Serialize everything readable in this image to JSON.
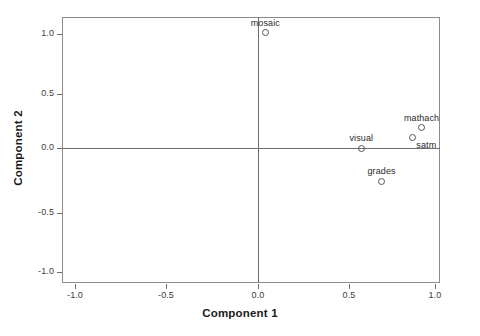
{
  "chart_data": {
    "type": "scatter",
    "title": "",
    "xlabel": "Component 1",
    "ylabel": "Component 2",
    "xlim": [
      -1.15,
      1.15
    ],
    "ylim": [
      -1.15,
      1.15
    ],
    "xticks": [
      "-1.0",
      "-0.5",
      "0.0",
      "0.5",
      "1.0"
    ],
    "xtick_values": [
      -1.0,
      -0.5,
      0.0,
      0.5,
      1.0
    ],
    "yticks": [
      "-1.0",
      "-0.5",
      "0.0",
      "0.5",
      "1.0"
    ],
    "ytick_values": [
      -1.0,
      -0.5,
      0.0,
      0.5,
      1.0
    ],
    "grid": false,
    "legend": "none",
    "reference_lines": {
      "x": 0.0,
      "y": 0.0
    },
    "marker": "open-circle",
    "points": [
      {
        "label": "mosaic",
        "x": 0.04,
        "y": 0.97,
        "label_pos": "above"
      },
      {
        "label": "mathach",
        "x": 0.9,
        "y": 0.17,
        "label_pos": "above"
      },
      {
        "label": "satm",
        "x": 0.85,
        "y": 0.085,
        "label_pos": "below-right"
      },
      {
        "label": "visual",
        "x": 0.57,
        "y": 0.0,
        "label_pos": "above"
      },
      {
        "label": "grades",
        "x": 0.68,
        "y": -0.28,
        "label_pos": "above"
      }
    ]
  },
  "axes": {
    "x_title": "Component 1",
    "y_title": "Component 2",
    "x_tick_labels": [
      "-1.0",
      "-0.5",
      "0.0",
      "0.5",
      "1.0"
    ],
    "y_tick_labels": [
      "1.0",
      "0.5",
      "0.0",
      "-0.5",
      "-1.0"
    ]
  },
  "colors": {
    "frame": "#8c8c8c",
    "reference_line": "#6e6e6e",
    "marker_stroke": "#555555",
    "text": "#231f20",
    "background": "#ffffff"
  }
}
